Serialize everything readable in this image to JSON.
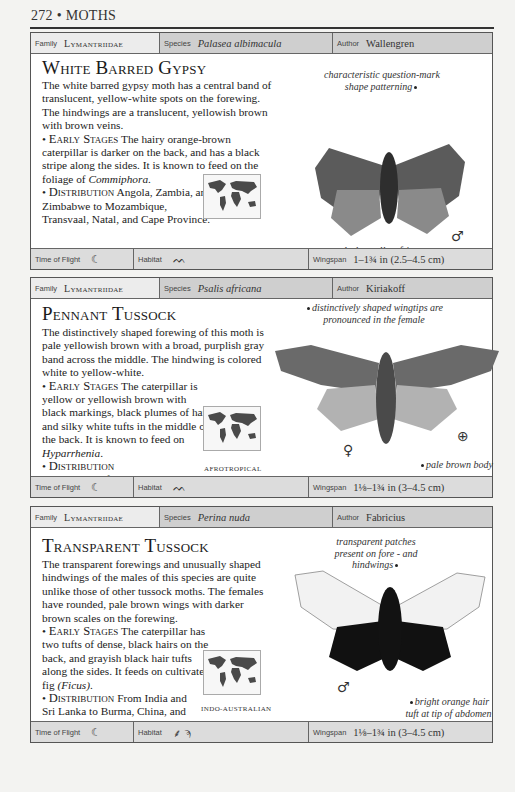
{
  "page": {
    "number": "272",
    "section": "MOTHS",
    "header": "272 • MOTHS"
  },
  "labels": {
    "family": "Family",
    "species": "Species",
    "author": "Author",
    "time_of_flight": "Time of Flight",
    "habitat": "Habitat",
    "wingspan": "Wingspan"
  },
  "entries": [
    {
      "family": "Lymantriidae",
      "species": "Palasea albimacula",
      "author": "Wallengren",
      "title": "White Barred Gypsy",
      "intro": "The white barred gypsy moth has a central band of translucent, yellow-white spots on the forewing. The hindwings are a translucent, yellowish brown with brown veins.",
      "early_stages_label": "Early Stages",
      "early_stages": "The hairy orange-brown caterpillar is darker on the back, and has a black stripe along the sides. It is known to feed on the foliage of",
      "food_plant": "Commiphora",
      "distribution_label": "Distribution",
      "distribution": "Angola, Zambia, and Zimbabwe to Mozambique, Transvaal, Natal, and Cape Province.",
      "region": "AFROTROPICAL",
      "annotations": [
        "characteristic question-mark shape patterning",
        "darker yellow fringes to hindwings"
      ],
      "sex_symbol": "♂",
      "time_of_flight_icon": "moon-icon",
      "habitat_icons": [
        "grassland-icon"
      ],
      "wingspan": "1–1¾ in (2.5–4.5 cm)",
      "moth_colors": {
        "forewing": "#5b5b5b",
        "hindwing": "#8a8a8a",
        "body": "#2e2e2e"
      }
    },
    {
      "family": "Lymantriidae",
      "species": "Psalis africana",
      "author": "Kiriakoff",
      "title": "Pennant Tussock",
      "intro": "The distinctively shaped forewing of this moth is pale yellowish brown with a broad, purplish gray band across the middle. The hindwing is colored white to yellow-white.",
      "early_stages_label": "Early Stages",
      "early_stages": "The caterpillar is yellow or yellowish brown with black markings, black plumes of hair, and silky white tufts in the middle of the back. It is known to feed on",
      "food_plant": "Hyparrhenia",
      "distribution_label": "Distribution",
      "distribution": "Throughout Africa.",
      "region": "AFROTROPICAL",
      "annotations": [
        "distinctively shaped wingtips are pronounced in the female",
        "pale brown body"
      ],
      "sex_symbol": "♀",
      "time_of_flight_icon": "moon-icon",
      "habitat_icons": [
        "grassland-icon"
      ],
      "wingspan": "1⅛–1¾ in (3–4.5 cm)",
      "moth_colors": {
        "forewing": "#6a6a6a",
        "hindwing": "#b2b2b2",
        "body": "#4a4a4a"
      }
    },
    {
      "family": "Lymantriidae",
      "species": "Perina nuda",
      "author": "Fabricius",
      "title": "Transparent Tussock",
      "intro": "The transparent forewings and unusually shaped hindwings of the males of this species are quite unlike those of other tussock moths. The females have rounded, pale brown wings with darker brown scales on the forewing.",
      "early_stages_label": "Early Stages",
      "early_stages": "The caterpillar has two tufts of dense, black hairs on the back, and grayish black hair tufts along the sides. It feeds on cultivated fig",
      "food_plant": "(Ficus)",
      "distribution_label": "Distribution",
      "distribution": "From India and Sri Lanka to Burma, China, and Taiwan.",
      "region": "INDO-AUSTRALIAN",
      "annotations": [
        "transparent patches present on fore - and hindwings",
        "bright orange hair tuft at tip of abdomen"
      ],
      "sex_symbol": "♂",
      "time_of_flight_icon": "moon-icon",
      "habitat_icons": [
        "cultivated-icon",
        "palm-tree-icon"
      ],
      "wingspan": "1⅛–1¾ in (3–4.5 cm)",
      "moth_colors": {
        "forewing": "#f2f2f2",
        "hindwing": "#111111",
        "body": "#121212"
      }
    }
  ]
}
